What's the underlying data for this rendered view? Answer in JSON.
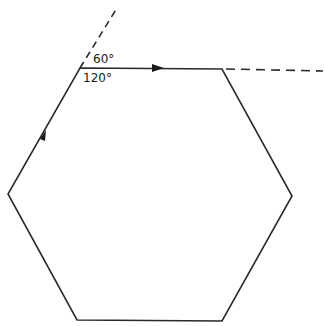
{
  "diagram": {
    "shape": "regular hexagon",
    "stroke_color": "#2a2a2a",
    "vertices": [
      [
        80,
        68
      ],
      [
        222,
        69
      ],
      [
        292,
        196
      ],
      [
        222,
        321
      ],
      [
        77,
        320
      ],
      [
        8,
        194
      ]
    ],
    "exterior_angle_label": "60°",
    "interior_angle_label": "120°",
    "dashed_extensions": [
      {
        "from": [
          80,
          68
        ],
        "to": [
          117,
          8
        ],
        "description": "extension of left edge beyond top-left vertex"
      },
      {
        "from": [
          222,
          69
        ],
        "to": [
          323,
          71
        ],
        "description": "extension of top edge beyond top-right vertex"
      }
    ],
    "arrows": [
      {
        "edge": "left-upper edge",
        "direction": "up-right",
        "at": [
          42,
          136
        ]
      },
      {
        "edge": "top edge",
        "direction": "right",
        "at": [
          158,
          68
        ]
      }
    ]
  }
}
